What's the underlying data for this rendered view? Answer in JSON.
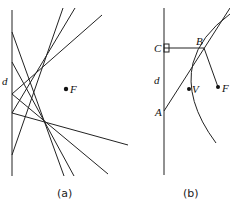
{
  "panel_a": {
    "caption": "(a)",
    "label_d": "d",
    "label_F": "F",
    "directrix": {
      "x": 12,
      "y1": 10,
      "y2": 176
    },
    "focus": {
      "x": 66,
      "y": 89
    },
    "lines": [
      {
        "x1": 12,
        "y1": 32,
        "x2": 64,
        "y2": 176
      },
      {
        "x1": 12,
        "y1": 62,
        "x2": 74,
        "y2": 176
      },
      {
        "x1": 12,
        "y1": 94,
        "x2": 108,
        "y2": 174
      },
      {
        "x1": 12,
        "y1": 113,
        "x2": 128,
        "y2": 145
      },
      {
        "x1": 12,
        "y1": 155,
        "x2": 63,
        "y2": 8
      },
      {
        "x1": 12,
        "y1": 113,
        "x2": 75,
        "y2": 8
      },
      {
        "x1": 12,
        "y1": 94,
        "x2": 102,
        "y2": 15
      }
    ]
  },
  "panel_b": {
    "caption": "(b)",
    "label_A": "A",
    "label_B": "B",
    "label_C": "C",
    "label_d": "d",
    "label_V": "V",
    "label_F": "F",
    "directrix": {
      "x": 164,
      "y1": 8,
      "y2": 175
    },
    "points": {
      "A": {
        "x": 164,
        "y": 111
      },
      "B": {
        "x": 204,
        "y": 48
      },
      "C": {
        "x": 164,
        "y": 48
      },
      "V": {
        "x": 189,
        "y": 89
      },
      "F": {
        "x": 218,
        "y": 87
      }
    }
  }
}
